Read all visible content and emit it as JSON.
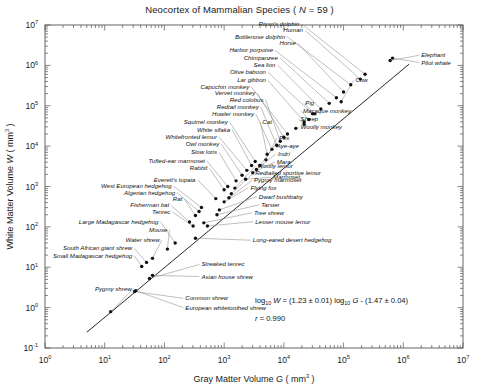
{
  "figure": {
    "title_main": "Neocortex of Mammalian Species ( ",
    "title_italic_n": "N",
    "title_eq": " = 59 )",
    "title_full": "Neocortex of Mammalian Species ( N = 59 )"
  },
  "annotations": {
    "equation_pre": "log",
    "equation_sub1": "10",
    "equation_w": " W",
    "equation_mid": " = (1.23 ± 0.01) log",
    "equation_sub2": "10",
    "equation_g": " G",
    "equation_tail": " - (1.47 ± 0.04)",
    "correlation": "r = 0.990",
    "correlation_r": "r",
    "correlation_val": " = 0.990"
  },
  "chart_data": {
    "type": "scatter",
    "title": "Neocortex of Mammalian Species ( N = 59 )",
    "xlabel": "Gray Matter Volume  G ( mm3 )",
    "xlabel_text": "Gray Matter Volume",
    "xlabel_sym": "G",
    "xlabel_unit": "( mm",
    "xlabel_exp": "3",
    "xlabel_close": " )",
    "ylabel": "White Matter Volume  W ( mm3 )",
    "ylabel_text": "White Matter Volume",
    "ylabel_sym": "W",
    "ylabel_unit": "( mm",
    "ylabel_exp": "3",
    "ylabel_close": " )",
    "xscale": "log",
    "yscale": "log",
    "xlim": [
      1,
      10000000
    ],
    "ylim": [
      0.1,
      10000000
    ],
    "xticks": [
      0,
      1,
      2,
      3,
      4,
      5,
      6,
      7
    ],
    "yticks": [
      -1,
      0,
      1,
      2,
      3,
      4,
      5,
      6,
      7
    ],
    "xtick_labels": [
      "10 0",
      "10 1",
      "10 2",
      "10 3",
      "10 4",
      "10 5",
      "10 6",
      "10 7"
    ],
    "ytick_labels": [
      "10 -1",
      "10 0",
      "10 1",
      "10 2",
      "10 3",
      "10 4",
      "10 5",
      "10 6",
      "10 7"
    ],
    "grid": false,
    "legend": "none",
    "n_points": 59,
    "fit": {
      "slope": 1.23,
      "slope_err": 0.01,
      "intercept": -1.47,
      "intercept_err": 0.04,
      "r": 0.99,
      "equation": "log10 W = (1.23 ± 0.01) log10 G - (1.47 ± 0.04)"
    },
    "points": [
      {
        "label": "Pygmy shrew",
        "logx": 1.1,
        "logy": -0.1,
        "lx": 1.45,
        "ly": 0.42,
        "anchor": "end"
      },
      {
        "label": "Common shrew",
        "logx": 1.5,
        "logy": 0.4,
        "lx": 2.35,
        "ly": 0.18,
        "anchor": "start"
      },
      {
        "label": "European whitetoothed shrew",
        "logx": 1.52,
        "logy": 0.42,
        "lx": 2.35,
        "ly": -0.05,
        "anchor": "start"
      },
      {
        "label": "Asian house shrew",
        "logx": 1.8,
        "logy": 0.8,
        "lx": 2.62,
        "ly": 0.72,
        "anchor": "start"
      },
      {
        "label": "Streaked tenrec",
        "logx": 1.75,
        "logy": 0.72,
        "lx": 2.62,
        "ly": 1.02,
        "anchor": "start"
      },
      {
        "label": "Small Madagascar hedgehog",
        "logx": 1.62,
        "logy": 1.02,
        "lx": 1.46,
        "ly": 1.24,
        "anchor": "end"
      },
      {
        "label": "South African giant shrew",
        "logx": 1.7,
        "logy": 1.12,
        "lx": 1.46,
        "ly": 1.42,
        "anchor": "end"
      },
      {
        "label": "Water shrew",
        "logx": 1.8,
        "logy": 1.22,
        "lx": 1.92,
        "ly": 1.62,
        "anchor": "end"
      },
      {
        "label": "Mouse",
        "logx": 2.05,
        "logy": 1.45,
        "lx": 2.05,
        "ly": 1.88,
        "anchor": "end"
      },
      {
        "label": "Large Madagascar hedgehog",
        "logx": 2.18,
        "logy": 1.6,
        "lx": 1.9,
        "ly": 2.08,
        "anchor": "end"
      },
      {
        "label": "Long-eared desert hedgehog",
        "logx": 2.52,
        "logy": 1.72,
        "lx": 3.48,
        "ly": 1.62,
        "anchor": "start"
      },
      {
        "label": "Lesser mouse lemur",
        "logx": 2.72,
        "logy": 2.02,
        "lx": 3.52,
        "ly": 2.08,
        "anchor": "start"
      },
      {
        "label": "Tree shrew",
        "logx": 2.66,
        "logy": 2.1,
        "lx": 3.5,
        "ly": 2.3,
        "anchor": "start"
      },
      {
        "label": "Tenrec",
        "logx": 2.48,
        "logy": 2.02,
        "lx": 2.1,
        "ly": 2.32,
        "anchor": "end"
      },
      {
        "label": "Fisherman bat",
        "logx": 2.42,
        "logy": 2.12,
        "lx": 2.08,
        "ly": 2.48,
        "anchor": "end"
      },
      {
        "label": "Rat",
        "logx": 2.52,
        "logy": 2.28,
        "lx": 2.3,
        "ly": 2.64,
        "anchor": "end"
      },
      {
        "label": "Algerian hedgehog",
        "logx": 2.58,
        "logy": 2.38,
        "lx": 2.18,
        "ly": 2.8,
        "anchor": "end"
      },
      {
        "label": "West European hedgehog",
        "logx": 2.62,
        "logy": 2.48,
        "lx": 2.12,
        "ly": 2.96,
        "anchor": "end"
      },
      {
        "label": "Tarsier",
        "logx": 2.88,
        "logy": 2.3,
        "lx": 3.62,
        "ly": 2.5,
        "anchor": "start"
      },
      {
        "label": "Dwarf bushbaby",
        "logx": 2.92,
        "logy": 2.42,
        "lx": 3.58,
        "ly": 2.7,
        "anchor": "start"
      },
      {
        "label": "Flying fox",
        "logx": 3.0,
        "logy": 2.62,
        "lx": 3.44,
        "ly": 2.92,
        "anchor": "start"
      },
      {
        "label": "Pygmy marmoset",
        "logx": 3.08,
        "logy": 2.72,
        "lx": 3.5,
        "ly": 3.1,
        "anchor": "start"
      },
      {
        "label": "Redtailed sportive lemur",
        "logx": 3.12,
        "logy": 2.82,
        "lx": 3.52,
        "ly": 3.28,
        "anchor": "start"
      },
      {
        "label": "Woolly lemur",
        "logx": 3.18,
        "logy": 2.96,
        "lx": 3.56,
        "ly": 3.46,
        "anchor": "start"
      },
      {
        "label": "Everett's tupaia",
        "logx": 2.86,
        "logy": 2.7,
        "lx": 2.52,
        "ly": 3.12,
        "anchor": "end"
      },
      {
        "label": "Rabbit",
        "logx": 3.0,
        "logy": 2.92,
        "lx": 2.72,
        "ly": 3.4,
        "anchor": "end"
      },
      {
        "label": "Tufted-ear marmoset",
        "logx": 3.06,
        "logy": 3.0,
        "lx": 2.68,
        "ly": 3.58,
        "anchor": "end"
      },
      {
        "label": "Marmoset",
        "logx": 3.36,
        "logy": 3.18,
        "lx": 3.82,
        "ly": 3.18,
        "anchor": "start"
      },
      {
        "label": "Mara",
        "logx": 3.48,
        "logy": 3.34,
        "lx": 3.88,
        "ly": 3.56,
        "anchor": "start"
      },
      {
        "label": "Indri",
        "logx": 3.54,
        "logy": 3.42,
        "lx": 3.9,
        "ly": 3.76,
        "anchor": "start"
      },
      {
        "label": "Aye-aye",
        "logx": 3.6,
        "logy": 3.52,
        "lx": 3.88,
        "ly": 3.96,
        "anchor": "start"
      },
      {
        "label": "Fox",
        "logx": 3.7,
        "logy": 3.66,
        "lx": 3.92,
        "ly": 4.16,
        "anchor": "start"
      },
      {
        "label": "Slow loris",
        "logx": 3.2,
        "logy": 3.14,
        "lx": 2.88,
        "ly": 3.8,
        "anchor": "end"
      },
      {
        "label": "Owl monkey",
        "logx": 3.3,
        "logy": 3.28,
        "lx": 2.92,
        "ly": 4.0,
        "anchor": "end"
      },
      {
        "label": "Whitefronted lemur",
        "logx": 3.38,
        "logy": 3.4,
        "lx": 2.88,
        "ly": 4.18,
        "anchor": "end"
      },
      {
        "label": "White sifaka",
        "logx": 3.46,
        "logy": 3.52,
        "lx": 3.1,
        "ly": 4.36,
        "anchor": "end"
      },
      {
        "label": "Squirrel monkey",
        "logx": 3.52,
        "logy": 3.62,
        "lx": 3.06,
        "ly": 4.54,
        "anchor": "end"
      },
      {
        "label": "Cat",
        "logx": 3.72,
        "logy": 3.8,
        "lx": 3.64,
        "ly": 4.54,
        "anchor": "start"
      },
      {
        "label": "Howler monkey",
        "logx": 3.8,
        "logy": 3.92,
        "lx": 3.5,
        "ly": 4.74,
        "anchor": "end"
      },
      {
        "label": "Redtail monkey",
        "logx": 3.88,
        "logy": 4.02,
        "lx": 3.58,
        "ly": 4.92,
        "anchor": "end"
      },
      {
        "label": "Red colobus",
        "logx": 3.94,
        "logy": 4.12,
        "lx": 3.66,
        "ly": 5.1,
        "anchor": "end"
      },
      {
        "label": "Vervet monkey",
        "logx": 4.0,
        "logy": 4.22,
        "lx": 3.52,
        "ly": 5.26,
        "anchor": "end"
      },
      {
        "label": "Capuchin monkey",
        "logx": 4.06,
        "logy": 4.3,
        "lx": 3.42,
        "ly": 5.42,
        "anchor": "end"
      },
      {
        "label": "Woolly monkey",
        "logx": 4.2,
        "logy": 4.44,
        "lx": 4.28,
        "ly": 4.42,
        "anchor": "start"
      },
      {
        "label": "Sheep",
        "logx": 4.34,
        "logy": 4.54,
        "lx": 4.28,
        "ly": 4.62,
        "anchor": "start"
      },
      {
        "label": "Macaque monkey",
        "logx": 4.42,
        "logy": 4.66,
        "lx": 4.32,
        "ly": 4.82,
        "anchor": "start"
      },
      {
        "label": "Pig",
        "logx": 4.52,
        "logy": 4.8,
        "lx": 4.36,
        "ly": 5.02,
        "anchor": "start"
      },
      {
        "label": "Lar gibbon",
        "logx": 4.34,
        "logy": 4.6,
        "lx": 3.7,
        "ly": 5.58,
        "anchor": "end"
      },
      {
        "label": "Olive baboon",
        "logx": 4.48,
        "logy": 4.8,
        "lx": 3.7,
        "ly": 5.78,
        "anchor": "end"
      },
      {
        "label": "Sea lion",
        "logx": 4.62,
        "logy": 4.92,
        "lx": 3.86,
        "ly": 5.96,
        "anchor": "end"
      },
      {
        "label": "Chimpanzee",
        "logx": 4.76,
        "logy": 5.06,
        "lx": 3.9,
        "ly": 6.14,
        "anchor": "end"
      },
      {
        "label": "Harbor porpoise",
        "logx": 4.88,
        "logy": 5.2,
        "lx": 3.82,
        "ly": 6.32,
        "anchor": "end"
      },
      {
        "label": "Cow",
        "logx": 4.96,
        "logy": 5.1,
        "lx": 5.2,
        "ly": 5.58,
        "anchor": "start"
      },
      {
        "label": "Horse",
        "logx": 5.0,
        "logy": 5.34,
        "lx": 4.2,
        "ly": 6.5,
        "anchor": "end"
      },
      {
        "label": "Bottlenose dolphin",
        "logx": 5.12,
        "logy": 5.52,
        "lx": 4.02,
        "ly": 6.66,
        "anchor": "end"
      },
      {
        "label": "Human",
        "logx": 5.28,
        "logy": 5.66,
        "lx": 4.32,
        "ly": 6.82,
        "anchor": "end"
      },
      {
        "label": "Risso's dolphin",
        "logx": 5.36,
        "logy": 5.78,
        "lx": 4.26,
        "ly": 6.98,
        "anchor": "end"
      },
      {
        "label": "Elephant",
        "logx": 5.78,
        "logy": 6.12,
        "lx": 6.3,
        "ly": 6.2,
        "anchor": "start"
      },
      {
        "label": "Pilot whale",
        "logx": 5.82,
        "logy": 6.18,
        "lx": 6.3,
        "ly": 6.02,
        "anchor": "start"
      }
    ],
    "line": {
      "x_start": 0.7,
      "x_end": 6.1
    }
  }
}
